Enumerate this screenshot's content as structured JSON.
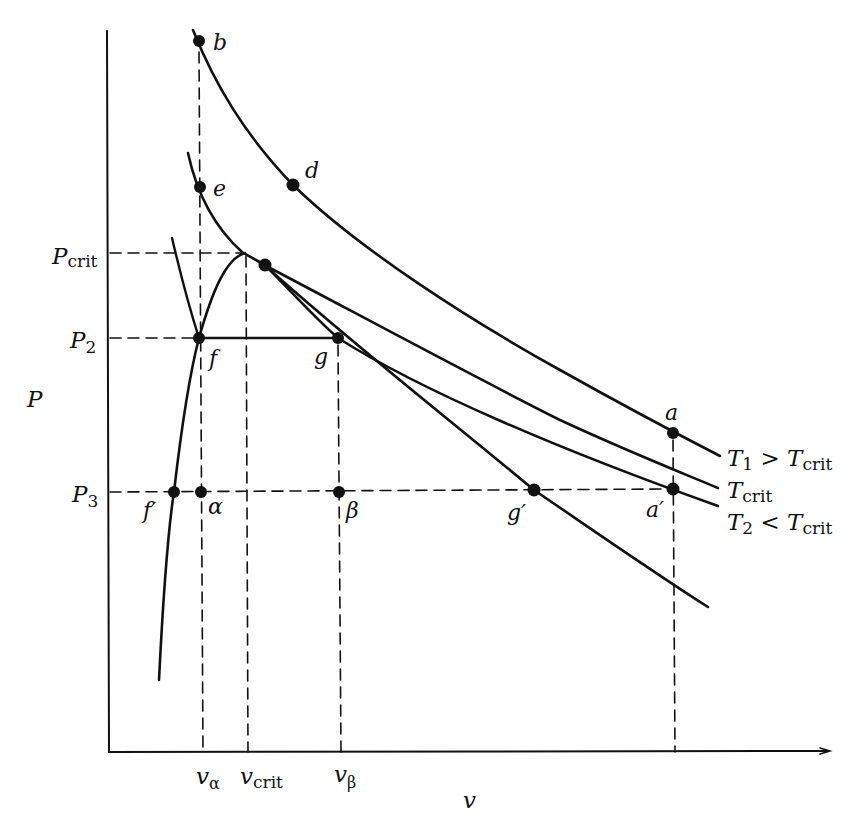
{
  "diagram": {
    "axes": {
      "y_label": "P",
      "x_label": "v",
      "y_ticks": [
        {
          "main": "P",
          "sub": "crit"
        },
        {
          "main": "P",
          "sub": "2"
        },
        {
          "main": "P",
          "sub": "3"
        }
      ],
      "x_ticks": [
        {
          "main": "v",
          "sub": "α"
        },
        {
          "main": "v",
          "sub": "crit"
        },
        {
          "main": "v",
          "sub": "β"
        }
      ]
    },
    "points": {
      "b": "b",
      "d": "d",
      "e": "e",
      "f": "f",
      "g": "g",
      "a": "a",
      "a_prime": "a′",
      "f_prime": "f′",
      "g_prime": "g′",
      "alpha": "α",
      "beta": "β"
    },
    "isotherms": [
      {
        "main": "T",
        "sub": "1",
        "rel": " > ",
        "main2": "T",
        "sub2": "crit"
      },
      {
        "main": "T",
        "sub": "crit"
      },
      {
        "main": "T",
        "sub": "2",
        "rel": " < ",
        "main2": "T",
        "sub2": "crit"
      }
    ],
    "colors": {
      "ink": "#111111",
      "background": "#ffffff"
    }
  }
}
